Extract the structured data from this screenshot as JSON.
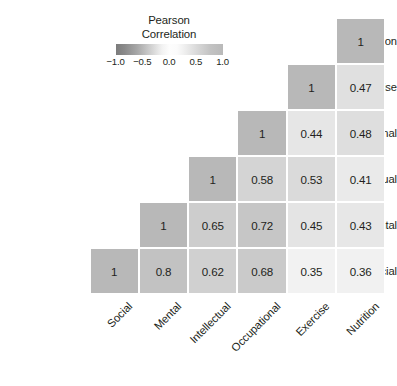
{
  "chart_data": {
    "type": "heatmap",
    "title": "",
    "subtitle": "",
    "xlabel": "",
    "ylabel": "",
    "grid": false,
    "legend_position": "top-left-inset",
    "colormap": "grayscale",
    "categories": [
      "Social",
      "Mental",
      "Intellectual",
      "Occupational",
      "Exercise",
      "Nutrition"
    ],
    "x_tick_labels": [
      "Social",
      "Mental",
      "Intellectual",
      "Occupational",
      "Exercise",
      "Nutrition"
    ],
    "y_tick_labels": [
      "Nutrition",
      "Exercise",
      "Occupational",
      "Intellectual",
      "Mental",
      "Social"
    ],
    "matrix_form": "lower-triangular",
    "value_range": [
      -1.0,
      1.0
    ],
    "rows": [
      {
        "label": "Nutrition",
        "cells": [
          {
            "x": "Nutrition",
            "value": "1",
            "numeric": 1.0,
            "color": "#b8b8b8"
          }
        ]
      },
      {
        "label": "Exercise",
        "cells": [
          {
            "x": "Exercise",
            "value": "1",
            "numeric": 1.0,
            "color": "#b8b8b8"
          },
          {
            "x": "Nutrition",
            "value": "0.47",
            "numeric": 0.47,
            "color": "#e0e0e0"
          }
        ]
      },
      {
        "label": "Occupational",
        "cells": [
          {
            "x": "Occupational",
            "value": "1",
            "numeric": 1.0,
            "color": "#b8b8b8"
          },
          {
            "x": "Exercise",
            "value": "0.44",
            "numeric": 0.44,
            "color": "#e6e6e6"
          },
          {
            "x": "Nutrition",
            "value": "0.48",
            "numeric": 0.48,
            "color": "#dedede"
          }
        ]
      },
      {
        "label": "Intellectual",
        "cells": [
          {
            "x": "Intellectual",
            "value": "1",
            "numeric": 1.0,
            "color": "#b8b8b8"
          },
          {
            "x": "Occupational",
            "value": "0.58",
            "numeric": 0.58,
            "color": "#d4d4d4"
          },
          {
            "x": "Exercise",
            "value": "0.53",
            "numeric": 0.53,
            "color": "#dadada"
          },
          {
            "x": "Nutrition",
            "value": "0.41",
            "numeric": 0.41,
            "color": "#eaeaea"
          }
        ]
      },
      {
        "label": "Mental",
        "cells": [
          {
            "x": "Mental",
            "value": "1",
            "numeric": 1.0,
            "color": "#b8b8b8"
          },
          {
            "x": "Intellectual",
            "value": "0.65",
            "numeric": 0.65,
            "color": "#cdcdcd"
          },
          {
            "x": "Occupational",
            "value": "0.72",
            "numeric": 0.72,
            "color": "#c6c6c6"
          },
          {
            "x": "Exercise",
            "value": "0.45",
            "numeric": 0.45,
            "color": "#e4e4e4"
          },
          {
            "x": "Nutrition",
            "value": "0.43",
            "numeric": 0.43,
            "color": "#e7e7e7"
          }
        ]
      },
      {
        "label": "Social",
        "cells": [
          {
            "x": "Social",
            "value": "1",
            "numeric": 1.0,
            "color": "#b8b8b8"
          },
          {
            "x": "Mental",
            "value": "0.8",
            "numeric": 0.8,
            "color": "#c2c2c2"
          },
          {
            "x": "Intellectual",
            "value": "0.62",
            "numeric": 0.62,
            "color": "#d0d0d0"
          },
          {
            "x": "Occupational",
            "value": "0.68",
            "numeric": 0.68,
            "color": "#cacaca"
          },
          {
            "x": "Exercise",
            "value": "0.35",
            "numeric": 0.35,
            "color": "#f2f2f2"
          },
          {
            "x": "Nutrition",
            "value": "0.36",
            "numeric": 0.36,
            "color": "#f1f1f1"
          }
        ]
      }
    ]
  },
  "legend": {
    "title_line1": "Pearson",
    "title_line2": "Correlation",
    "ticks": [
      "−1.0",
      "−0.5",
      "0.0",
      "0.5",
      "1.0"
    ],
    "tick_values": [
      -1.0,
      -0.5,
      0.0,
      0.5,
      1.0
    ],
    "min": -1.0,
    "max": 1.0
  }
}
